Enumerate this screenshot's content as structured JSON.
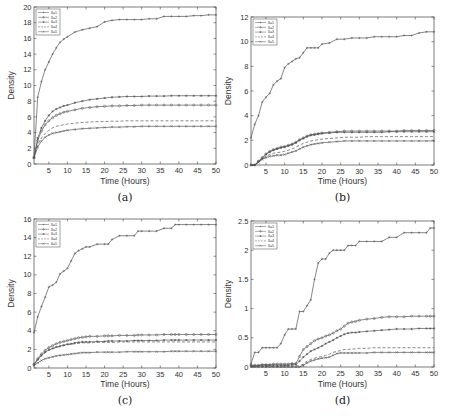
{
  "chart_data": [
    {
      "type": "line",
      "caption": "(a)",
      "xlabel": "Time (Hours)",
      "ylabel": "Density",
      "xlim": [
        1,
        50
      ],
      "ylim": [
        0,
        20
      ],
      "xticks": [
        5,
        10,
        15,
        20,
        25,
        30,
        35,
        40,
        45,
        50
      ],
      "yticks": [
        0,
        2,
        4,
        6,
        8,
        10,
        12,
        14,
        16,
        18,
        20
      ],
      "legend_position": "top-left",
      "x": [
        1,
        2,
        3,
        4,
        5,
        6,
        7,
        8,
        9,
        10,
        12,
        14,
        16,
        18,
        20,
        22,
        24,
        26,
        28,
        30,
        32,
        34,
        36,
        38,
        40,
        42,
        44,
        46,
        48,
        50
      ],
      "series": [
        {
          "name": "δ=1",
          "style": "solid-plus",
          "values": [
            0.8,
            8.5,
            10.5,
            12,
            13,
            14,
            14.8,
            15.5,
            15.9,
            16.2,
            16.8,
            17.1,
            17.3,
            17.5,
            18.1,
            18.3,
            18.4,
            18.4,
            18.4,
            18.4,
            18.5,
            18.5,
            18.8,
            18.8,
            18.8,
            18.8,
            18.9,
            18.9,
            19,
            19
          ]
        },
        {
          "name": "δ=2",
          "style": "solid-circle",
          "values": [
            0.8,
            3,
            4.2,
            5,
            5.5,
            5.9,
            6.2,
            6.4,
            6.6,
            6.7,
            6.9,
            7.1,
            7.2,
            7.3,
            7.35,
            7.4,
            7.4,
            7.45,
            7.45,
            7.5,
            7.5,
            7.5,
            7.5,
            7.5,
            7.5,
            7.5,
            7.5,
            7.5,
            7.5,
            7.5
          ]
        },
        {
          "name": "δ=3",
          "style": "solid-star",
          "values": [
            0.8,
            3.3,
            4.6,
            5.5,
            6.2,
            6.7,
            7,
            7.2,
            7.4,
            7.5,
            7.8,
            8,
            8.2,
            8.3,
            8.4,
            8.5,
            8.55,
            8.6,
            8.6,
            8.6,
            8.65,
            8.65,
            8.65,
            8.7,
            8.7,
            8.7,
            8.7,
            8.7,
            8.7,
            8.7
          ]
        },
        {
          "name": "δ=4",
          "style": "dashed",
          "values": [
            0.8,
            2.5,
            3.3,
            3.9,
            4.3,
            4.6,
            4.8,
            4.9,
            5,
            5.1,
            5.2,
            5.3,
            5.35,
            5.4,
            5.4,
            5.45,
            5.45,
            5.5,
            5.5,
            5.5,
            5.5,
            5.5,
            5.5,
            5.5,
            5.5,
            5.5,
            5.5,
            5.5,
            5.5,
            5.5
          ]
        },
        {
          "name": "δ=5",
          "style": "solid-x",
          "values": [
            0.8,
            2.2,
            2.9,
            3.4,
            3.7,
            3.9,
            4,
            4.1,
            4.2,
            4.3,
            4.4,
            4.5,
            4.55,
            4.6,
            4.65,
            4.7,
            4.7,
            4.75,
            4.75,
            4.8,
            4.8,
            4.8,
            4.8,
            4.8,
            4.8,
            4.8,
            4.8,
            4.8,
            4.8,
            4.8
          ]
        }
      ]
    },
    {
      "type": "line",
      "caption": "(b)",
      "xlabel": "Time (Hours)",
      "ylabel": "Density",
      "xlim": [
        1,
        50
      ],
      "ylim": [
        0,
        12
      ],
      "xticks": [
        5,
        10,
        15,
        20,
        25,
        30,
        35,
        40,
        45,
        50
      ],
      "yticks": [
        0,
        2,
        4,
        6,
        8,
        10,
        12
      ],
      "legend_position": "top-left",
      "x": [
        1,
        2,
        3,
        4,
        5,
        6,
        7,
        8,
        9,
        10,
        11,
        12,
        13,
        14,
        15,
        16,
        17,
        18,
        19,
        20,
        22,
        24,
        26,
        28,
        30,
        32,
        34,
        36,
        38,
        40,
        42,
        44,
        46,
        48,
        50
      ],
      "series": [
        {
          "name": "δ=1",
          "style": "solid-plus",
          "values": [
            2.2,
            3.3,
            4,
            5.1,
            5.5,
            5.8,
            6.5,
            6.8,
            7,
            7.9,
            8.2,
            8.4,
            8.6,
            8.7,
            9.1,
            9.5,
            9.5,
            9.5,
            9.5,
            9.8,
            9.9,
            10.2,
            10.2,
            10.3,
            10.3,
            10.3,
            10.4,
            10.4,
            10.4,
            10.4,
            10.5,
            10.5,
            10.7,
            10.8,
            10.8
          ]
        },
        {
          "name": "δ=2",
          "style": "solid-circle",
          "values": [
            0,
            0,
            0.3,
            0.6,
            0.9,
            1.1,
            1.25,
            1.35,
            1.45,
            1.5,
            1.6,
            1.7,
            1.85,
            2.05,
            2.2,
            2.35,
            2.45,
            2.5,
            2.55,
            2.6,
            2.65,
            2.7,
            2.75,
            2.75,
            2.75,
            2.75,
            2.75,
            2.75,
            2.75,
            2.75,
            2.8,
            2.8,
            2.8,
            2.8,
            2.8
          ]
        },
        {
          "name": "δ=3",
          "style": "solid-star",
          "values": [
            0,
            0,
            0.3,
            0.55,
            0.85,
            1.05,
            1.2,
            1.3,
            1.4,
            1.45,
            1.55,
            1.65,
            1.8,
            2,
            2.15,
            2.3,
            2.4,
            2.45,
            2.5,
            2.55,
            2.6,
            2.65,
            2.65,
            2.65,
            2.65,
            2.65,
            2.65,
            2.65,
            2.7,
            2.7,
            2.7,
            2.7,
            2.7,
            2.7,
            2.7
          ]
        },
        {
          "name": "δ=4",
          "style": "dashed",
          "values": [
            0,
            0,
            0.25,
            0.5,
            0.7,
            0.85,
            0.95,
            1,
            1.05,
            1.1,
            1.2,
            1.3,
            1.45,
            1.6,
            1.75,
            1.85,
            1.95,
            2,
            2.05,
            2.1,
            2.15,
            2.2,
            2.25,
            2.25,
            2.25,
            2.3,
            2.3,
            2.3,
            2.3,
            2.3,
            2.3,
            2.3,
            2.3,
            2.3,
            2.3
          ]
        },
        {
          "name": "δ=5",
          "style": "solid-x",
          "values": [
            0,
            0,
            0.2,
            0.45,
            0.6,
            0.7,
            0.75,
            0.8,
            0.8,
            0.85,
            0.95,
            1.05,
            1.15,
            1.3,
            1.45,
            1.55,
            1.65,
            1.7,
            1.75,
            1.8,
            1.85,
            1.9,
            1.95,
            1.95,
            1.95,
            1.95,
            1.95,
            1.95,
            1.95,
            1.95,
            1.95,
            1.95,
            1.95,
            1.95,
            1.95
          ]
        }
      ]
    },
    {
      "type": "line",
      "caption": "(c)",
      "xlabel": "Time (Hours)",
      "ylabel": "Density",
      "xlim": [
        1,
        50
      ],
      "ylim": [
        0,
        16
      ],
      "xticks": [
        5,
        10,
        15,
        20,
        25,
        30,
        35,
        40,
        45,
        50
      ],
      "yticks": [
        0,
        2,
        4,
        6,
        8,
        10,
        12,
        14,
        16
      ],
      "legend_position": "top-left",
      "x": [
        1,
        2,
        3,
        4,
        5,
        6,
        7,
        8,
        9,
        10,
        11,
        12,
        13,
        14,
        15,
        16,
        18,
        20,
        21,
        22,
        24,
        26,
        28,
        29,
        30,
        32,
        34,
        36,
        38,
        39,
        40,
        42,
        44,
        46,
        48,
        50
      ],
      "series": [
        {
          "name": "δ=1",
          "style": "solid-plus",
          "values": [
            3.8,
            5.5,
            6.6,
            7.6,
            8.7,
            8.9,
            9.2,
            10.1,
            10.4,
            10.7,
            11.5,
            12.3,
            12.6,
            12.8,
            13,
            13,
            13.3,
            13.3,
            13.3,
            13.8,
            14.2,
            14.2,
            14.2,
            14.7,
            14.7,
            14.7,
            14.7,
            15,
            15,
            15.4,
            15.4,
            15.4,
            15.4,
            15.4,
            15.4,
            15.4
          ]
        },
        {
          "name": "δ=2",
          "style": "solid-circle",
          "values": [
            0.4,
            1,
            1.5,
            1.9,
            2.2,
            2.4,
            2.6,
            2.75,
            2.85,
            2.95,
            3.05,
            3.15,
            3.25,
            3.3,
            3.35,
            3.4,
            3.4,
            3.45,
            3.45,
            3.45,
            3.5,
            3.5,
            3.5,
            3.55,
            3.55,
            3.55,
            3.55,
            3.6,
            3.6,
            3.6,
            3.6,
            3.6,
            3.6,
            3.6,
            3.6,
            3.6
          ]
        },
        {
          "name": "δ=3",
          "style": "solid-star",
          "values": [
            0.35,
            0.9,
            1.35,
            1.7,
            1.95,
            2.1,
            2.25,
            2.35,
            2.45,
            2.55,
            2.6,
            2.7,
            2.75,
            2.8,
            2.8,
            2.8,
            2.85,
            2.85,
            2.9,
            2.9,
            2.9,
            2.9,
            2.95,
            2.95,
            2.95,
            2.95,
            2.95,
            3,
            3,
            3,
            3,
            3,
            3,
            3,
            3,
            3
          ]
        },
        {
          "name": "δ=4",
          "style": "dashed",
          "values": [
            0.35,
            0.85,
            1.3,
            1.65,
            1.9,
            2.05,
            2.2,
            2.3,
            2.4,
            2.5,
            2.55,
            2.6,
            2.65,
            2.7,
            2.7,
            2.7,
            2.75,
            2.75,
            2.75,
            2.75,
            2.8,
            2.8,
            2.8,
            2.8,
            2.8,
            2.8,
            2.8,
            2.8,
            2.8,
            2.8,
            2.8,
            2.8,
            2.8,
            2.8,
            2.8,
            2.8
          ]
        },
        {
          "name": "δ=5",
          "style": "solid-x",
          "values": [
            0.25,
            0.55,
            0.8,
            1,
            1.1,
            1.2,
            1.3,
            1.35,
            1.4,
            1.45,
            1.5,
            1.55,
            1.6,
            1.65,
            1.65,
            1.65,
            1.7,
            1.7,
            1.7,
            1.7,
            1.7,
            1.75,
            1.75,
            1.75,
            1.75,
            1.75,
            1.75,
            1.75,
            1.8,
            1.8,
            1.8,
            1.8,
            1.8,
            1.8,
            1.8,
            1.8
          ]
        }
      ]
    },
    {
      "type": "line",
      "caption": "(d)",
      "xlabel": "Time (Hours)",
      "ylabel": "Density",
      "xlim": [
        1,
        50
      ],
      "ylim": [
        0,
        2.5
      ],
      "xticks": [
        5,
        10,
        15,
        20,
        25,
        30,
        35,
        40,
        45,
        50
      ],
      "yticks": [
        0,
        0.5,
        1,
        1.5,
        2,
        2.5
      ],
      "yticklabels": [
        "0",
        "0.5",
        "1",
        "1.5",
        "2",
        "2.5"
      ],
      "legend_position": "top-left",
      "x": [
        1,
        2,
        3,
        4,
        5,
        6,
        7,
        8,
        9,
        10,
        11,
        12,
        13,
        14,
        15,
        16,
        17,
        18,
        19,
        20,
        21,
        22,
        23,
        24,
        25,
        26,
        27,
        28,
        29,
        30,
        32,
        34,
        36,
        38,
        40,
        42,
        44,
        46,
        48,
        49,
        50
      ],
      "series": [
        {
          "name": "δ=1",
          "style": "solid-plus",
          "values": [
            0.05,
            0.25,
            0.25,
            0.33,
            0.33,
            0.33,
            0.33,
            0.33,
            0.4,
            0.55,
            0.65,
            0.65,
            0.65,
            0.95,
            0.95,
            1.05,
            1.15,
            1.5,
            1.78,
            1.85,
            1.85,
            1.95,
            2,
            2,
            2,
            2,
            2.08,
            2.08,
            2.08,
            2.15,
            2.15,
            2.15,
            2.15,
            2.22,
            2.22,
            2.3,
            2.3,
            2.3,
            2.3,
            2.38,
            2.38
          ]
        },
        {
          "name": "δ=2",
          "style": "solid-circle",
          "values": [
            0.03,
            0.03,
            0.03,
            0.04,
            0.04,
            0.04,
            0.05,
            0.05,
            0.05,
            0.05,
            0.05,
            0.06,
            0.06,
            0.18,
            0.3,
            0.35,
            0.4,
            0.45,
            0.48,
            0.5,
            0.53,
            0.55,
            0.58,
            0.62,
            0.65,
            0.7,
            0.75,
            0.77,
            0.78,
            0.8,
            0.82,
            0.83,
            0.85,
            0.86,
            0.86,
            0.86,
            0.87,
            0.87,
            0.87,
            0.87,
            0.87
          ]
        },
        {
          "name": "δ=3",
          "style": "solid-star",
          "values": [
            0.02,
            0.02,
            0.02,
            0.03,
            0.03,
            0.03,
            0.03,
            0.03,
            0.03,
            0.03,
            0.03,
            0.04,
            0.04,
            0.1,
            0.17,
            0.22,
            0.27,
            0.3,
            0.33,
            0.36,
            0.4,
            0.43,
            0.46,
            0.5,
            0.53,
            0.56,
            0.58,
            0.59,
            0.59,
            0.6,
            0.61,
            0.62,
            0.63,
            0.64,
            0.65,
            0.65,
            0.65,
            0.66,
            0.66,
            0.66,
            0.66
          ]
        },
        {
          "name": "δ=4",
          "style": "dashed",
          "values": [
            0.01,
            0.01,
            0.01,
            0.01,
            0.01,
            0.01,
            0.01,
            0.01,
            0.01,
            0.02,
            0.02,
            0.02,
            0.02,
            0.02,
            0.05,
            0.1,
            0.13,
            0.15,
            0.17,
            0.18,
            0.2,
            0.22,
            0.25,
            0.27,
            0.28,
            0.3,
            0.3,
            0.31,
            0.31,
            0.32,
            0.32,
            0.33,
            0.33,
            0.33,
            0.33,
            0.33,
            0.33,
            0.33,
            0.33,
            0.33,
            0.33
          ]
        },
        {
          "name": "δ=5",
          "style": "solid-x",
          "values": [
            0,
            0,
            0,
            0,
            0,
            0,
            0,
            0,
            0,
            0,
            0,
            0,
            0,
            0,
            0.03,
            0.07,
            0.1,
            0.12,
            0.14,
            0.15,
            0.16,
            0.17,
            0.2,
            0.23,
            0.24,
            0.24,
            0.24,
            0.24,
            0.24,
            0.24,
            0.24,
            0.25,
            0.25,
            0.25,
            0.25,
            0.25,
            0.25,
            0.25,
            0.25,
            0.25,
            0.25
          ]
        }
      ]
    }
  ]
}
